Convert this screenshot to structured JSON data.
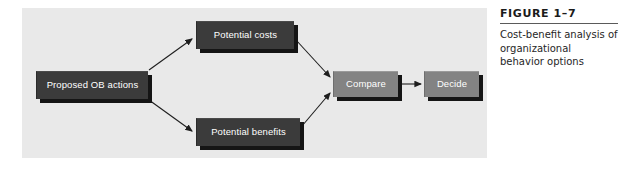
{
  "figure": {
    "caption_label": "FIGURE 1–7",
    "caption_text": "Cost-benefit analysis of organizational behavior options",
    "panel_bg": "#e9e9e9",
    "nodes": [
      {
        "id": "actions",
        "label": "Proposed OB actions",
        "style": "dark"
      },
      {
        "id": "costs",
        "label": "Potential costs",
        "style": "dark"
      },
      {
        "id": "benefits",
        "label": "Potential benefits",
        "style": "dark"
      },
      {
        "id": "compare",
        "label": "Compare",
        "style": "mid"
      },
      {
        "id": "decide",
        "label": "Decide",
        "style": "mid"
      }
    ],
    "edges": [
      {
        "from": "actions",
        "to": "costs"
      },
      {
        "from": "actions",
        "to": "benefits"
      },
      {
        "from": "costs",
        "to": "compare"
      },
      {
        "from": "benefits",
        "to": "compare"
      },
      {
        "from": "compare",
        "to": "decide"
      }
    ],
    "colors": {
      "node_dark": "#3b3b3b",
      "node_mid": "#838383",
      "node_text": "#ffffff",
      "shadow": "#151515",
      "connector": "#1e1e1e"
    }
  }
}
